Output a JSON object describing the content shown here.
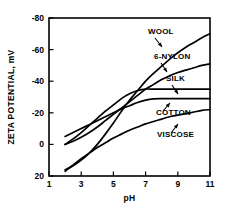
{
  "chart_data": {
    "type": "line",
    "title": "",
    "xlabel": "pH",
    "ylabel": "ZETA POTENTIAL, mV",
    "xlim": [
      1,
      11
    ],
    "ylim": [
      20,
      -80
    ],
    "y_axis_inverted": true,
    "grid": false,
    "legend_position": "inline-annotations",
    "xticks": [
      1,
      3,
      5,
      7,
      9,
      11
    ],
    "xtick_labels": [
      "1",
      "3",
      "5",
      "7",
      "9",
      "11"
    ],
    "yticks": [
      -80,
      -60,
      -40,
      -20,
      0,
      20
    ],
    "ytick_labels": [
      "-80",
      "-60",
      "-40",
      "-20",
      "0",
      "20"
    ],
    "series": [
      {
        "name": "WOOL",
        "label": "WOOL",
        "x": [
          2.0,
          2.5,
          3.0,
          3.5,
          4.0,
          4.5,
          5.0,
          5.5,
          6.0,
          6.5,
          7.0,
          7.5,
          8.0,
          8.5,
          9.0,
          9.5,
          10.0,
          10.5,
          11.0
        ],
        "y": [
          16.0,
          13.5,
          10.0,
          5.5,
          0.0,
          -6.5,
          -13.5,
          -21.0,
          -28.0,
          -34.0,
          -40.0,
          -45.0,
          -49.5,
          -54.0,
          -58.0,
          -61.5,
          -64.5,
          -67.5,
          -70.0
        ]
      },
      {
        "name": "6-NYLON",
        "label": "6-NYLON",
        "x": [
          2.0,
          2.5,
          3.0,
          3.5,
          4.0,
          4.5,
          5.0,
          5.5,
          6.0,
          6.5,
          7.0,
          7.5,
          8.0,
          8.5,
          9.0,
          9.5,
          10.0,
          10.5,
          11.0
        ],
        "y": [
          0.0,
          -2.0,
          -4.5,
          -7.5,
          -11.0,
          -15.0,
          -19.0,
          -23.0,
          -27.0,
          -31.0,
          -35.0,
          -38.0,
          -41.0,
          -43.5,
          -45.5,
          -47.0,
          -48.5,
          -50.0,
          -51.0
        ]
      },
      {
        "name": "SILK",
        "label": "SILK",
        "x": [
          2.0,
          2.5,
          3.0,
          3.5,
          4.0,
          4.5,
          5.0,
          5.5,
          6.0,
          6.5,
          7.0,
          7.5,
          8.0,
          9.0,
          10.0,
          11.0
        ],
        "y": [
          0.0,
          -3.5,
          -7.5,
          -12.0,
          -16.5,
          -21.0,
          -25.0,
          -29.0,
          -32.0,
          -34.0,
          -35.0,
          -35.0,
          -35.0,
          -35.0,
          -35.0,
          -35.0
        ]
      },
      {
        "name": "COTTON",
        "label": "COTTON",
        "x": [
          2.0,
          2.5,
          3.0,
          3.5,
          4.0,
          4.5,
          5.0,
          5.5,
          6.0,
          6.5,
          7.0,
          7.5,
          8.0,
          9.0,
          10.0,
          11.0
        ],
        "y": [
          -5.0,
          -7.5,
          -10.0,
          -12.5,
          -15.0,
          -17.5,
          -20.0,
          -22.5,
          -24.5,
          -26.5,
          -28.0,
          -28.8,
          -29.0,
          -29.0,
          -29.0,
          -29.0
        ]
      },
      {
        "name": "VISCOSE",
        "label": "VISCOSE",
        "x": [
          2.0,
          2.5,
          3.0,
          3.5,
          4.0,
          4.5,
          5.0,
          5.5,
          6.0,
          6.5,
          7.0,
          7.5,
          8.0,
          8.5,
          9.0,
          9.5,
          10.0,
          10.5,
          11.0
        ],
        "y": [
          17.0,
          13.0,
          9.0,
          5.5,
          2.0,
          -1.0,
          -4.0,
          -6.5,
          -9.0,
          -11.0,
          -13.0,
          -14.5,
          -16.0,
          -17.5,
          -18.5,
          -19.5,
          -20.5,
          -21.5,
          -22.0
        ]
      }
    ],
    "annotations": [
      {
        "text": "WOOL",
        "label_x": 148,
        "label_y": 34,
        "arrow_from_x": 155,
        "arrow_from_y": 38,
        "arrow_to_x": 162,
        "arrow_to_y": 47
      },
      {
        "text": "6-NYLON",
        "label_x": 154,
        "label_y": 59,
        "arrow_from_x": 161,
        "arrow_from_y": 63,
        "arrow_to_x": 167,
        "arrow_to_y": 72
      },
      {
        "text": "SILK",
        "label_x": 166,
        "label_y": 81,
        "arrow_from_x": 172,
        "arrow_from_y": 85,
        "arrow_to_x": 178,
        "arrow_to_y": 94
      },
      {
        "text": "COTTON",
        "label_x": 156,
        "label_y": 115,
        "arrow_from_x": 163,
        "arrow_from_y": 111,
        "arrow_to_x": 170,
        "arrow_to_y": 103
      },
      {
        "text": "VISCOSE",
        "label_x": 157,
        "label_y": 137,
        "arrow_from_x": 171,
        "arrow_from_y": 133,
        "arrow_to_x": 178,
        "arrow_to_y": 124
      }
    ],
    "colors": {
      "axis": "#000000",
      "curve": "#000000",
      "background": "#ffffff"
    }
  }
}
